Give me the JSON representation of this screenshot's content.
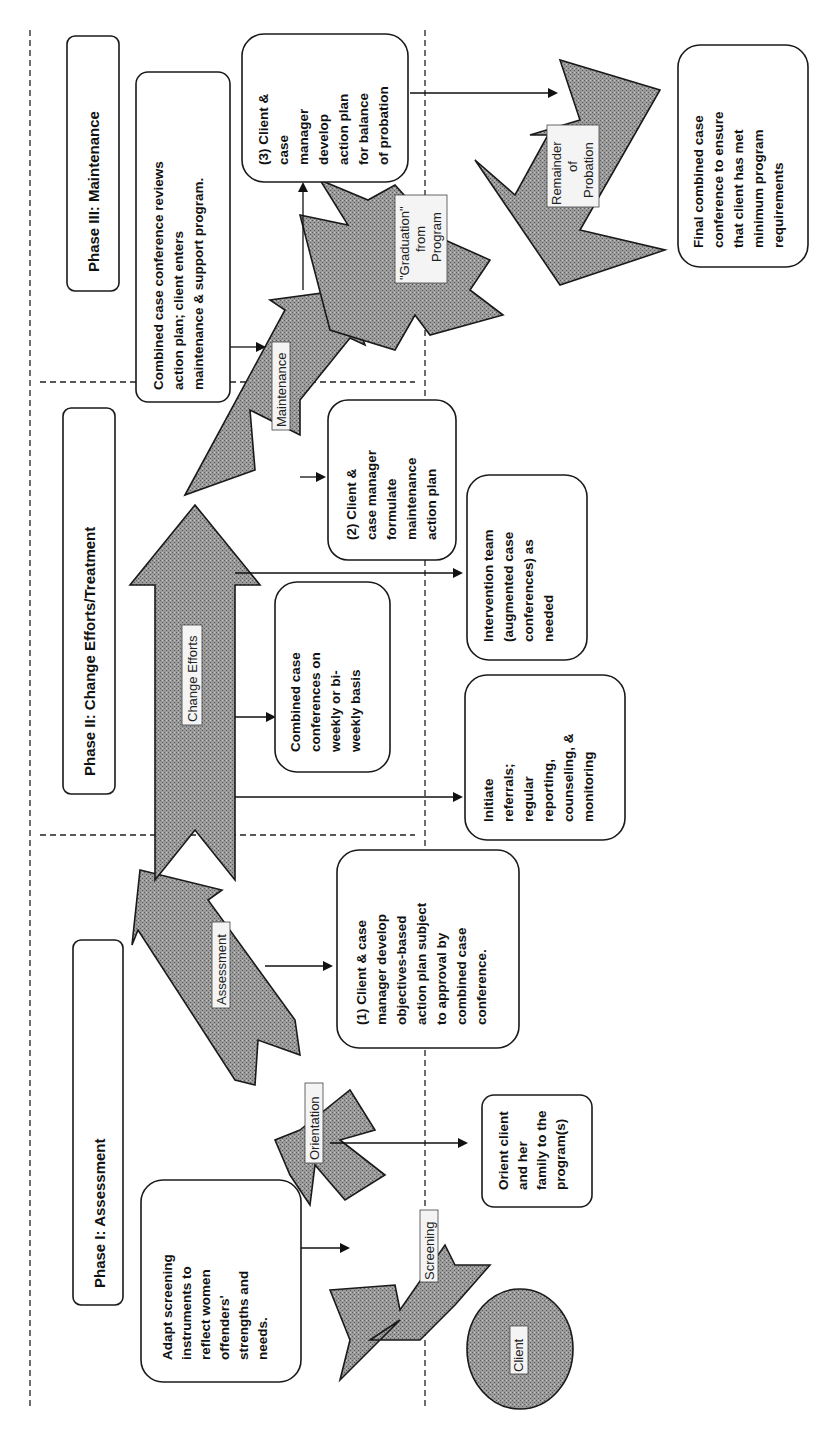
{
  "phases": [
    {
      "label": "Phase I:  Assessment"
    },
    {
      "label": "Phase II:  Change Efforts/Treatment"
    },
    {
      "label": "Phase III:  Maintenance"
    }
  ],
  "client": {
    "label": "Client"
  },
  "stages": {
    "screening": "Screening",
    "orientation": "Orientation",
    "assessment": "Assessment",
    "change_efforts": "Change Efforts",
    "maintenance": "Maintenance",
    "graduation": [
      "\"Graduation\"",
      "from",
      "Program"
    ],
    "remainder": [
      "Remainder",
      "of",
      "Probation"
    ]
  },
  "boxes": {
    "adapt_screening": [
      "Adapt screening",
      "instruments  to",
      "reflect women",
      "offenders'",
      "strengths and",
      "needs."
    ],
    "orient_client": [
      "Orient client",
      "and her",
      "family to the",
      "program(s)"
    ],
    "action_plan_1": [
      "(1) Client & case",
      "manager develop",
      "objectives-based",
      "action plan subject",
      "to approval by",
      "combined case",
      "conference."
    ],
    "combined_weekly": [
      "Combined case",
      "conferences on",
      "weekly or bi-",
      "weekly basis"
    ],
    "initiate_referrals": [
      "Initiate",
      "referrals;",
      "regular",
      "reporting,",
      "counseling, &",
      "monitoring"
    ],
    "intervention_team": [
      "Intervention team",
      "(augmented case",
      "conferences) as",
      "needed"
    ],
    "action_plan_2": [
      "(2) Client &",
      "case manager",
      "formulate",
      "maintenance",
      "action plan"
    ],
    "combined_review": [
      "Combined case conference reviews",
      "action plan; client enters",
      "maintenance & support program."
    ],
    "action_plan_3": [
      "(3) Client &",
      "case",
      "manager",
      "develop",
      "action plan",
      "for balance",
      "of probation"
    ],
    "final_conference": [
      "Final combined case",
      "conference to ensure",
      "that client has met",
      "minimum program",
      "requirements"
    ]
  },
  "colors": {
    "arrow_fill": "#8a8a8a",
    "line": "#1a1a1a",
    "background": "#ffffff"
  }
}
